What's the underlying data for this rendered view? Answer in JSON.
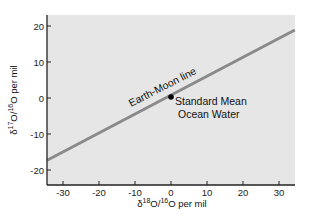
{
  "chart_data": {
    "type": "line",
    "title": "",
    "xlabel": "δ18O/16O per mil",
    "ylabel": "δ17O/16O per mil",
    "xlim": [
      -34.4,
      34.4
    ],
    "ylim": [
      -24,
      21
    ],
    "x_ticks": [
      -30,
      -20,
      -10,
      0,
      10,
      20,
      30
    ],
    "y_ticks": [
      -20,
      -10,
      0,
      10,
      20
    ],
    "grid": false,
    "legend": null,
    "series": [
      {
        "name": "Earth-Moon line",
        "x": [
          -34.4,
          34.4
        ],
        "y": [
          -17.3,
          18.9
        ],
        "slope": 0.52,
        "color": "#8a8a8a"
      }
    ],
    "points": [
      {
        "name": "Standard Mean Ocean Water",
        "x": 0,
        "y": 0,
        "color": "#000000"
      }
    ],
    "annotations": [
      {
        "text": "Earth-Moon line",
        "x": -12,
        "y": 3,
        "rotation": -27
      },
      {
        "text": "Standard Mean",
        "x": 1,
        "y": -2
      },
      {
        "text": "Ocean Water",
        "x": 1,
        "y": -5.5
      }
    ],
    "background_color": "#e6e6e6"
  },
  "labels": {
    "xlabel_main": "δ",
    "xlabel_sup1": "18",
    "xlabel_mid": "O/",
    "xlabel_sup2": "16",
    "xlabel_end": "O per mil",
    "ylabel_main": "δ",
    "ylabel_sup1": "17",
    "ylabel_mid": "O/",
    "ylabel_sup2": "16",
    "ylabel_end": "O per mil",
    "line_label": "Earth-Moon line",
    "point_label_1": "Standard Mean",
    "point_label_2": "Ocean Water"
  }
}
